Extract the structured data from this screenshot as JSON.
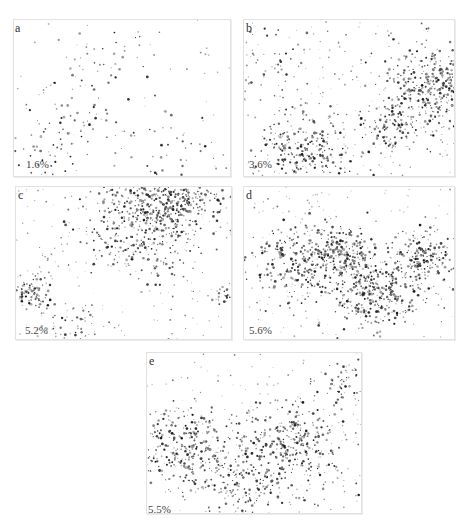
{
  "figure": {
    "panels": [
      {
        "id": "a",
        "letter": "a",
        "percent": "1.6%",
        "box": [
          13,
          19,
          216,
          156
        ],
        "letter_pos": [
          1,
          2
        ],
        "pct_pos": [
          12,
          139
        ],
        "density": 0.25,
        "clusters": [
          [
            30,
            65,
            12,
            60
          ],
          [
            70,
            84,
            12,
            50
          ],
          [
            15,
            88,
            10,
            40
          ],
          [
            40,
            20,
            10,
            30
          ]
        ]
      },
      {
        "id": "b",
        "letter": "b",
        "percent": "3.6%",
        "box": [
          243,
          19,
          210,
          156
        ],
        "letter_pos": [
          2,
          2
        ],
        "pct_pos": [
          5,
          139
        ],
        "density": 1.0,
        "clusters": [
          [
            93,
            43,
            11,
            420
          ],
          [
            30,
            85,
            10,
            260
          ],
          [
            70,
            68,
            6,
            90
          ],
          [
            15,
            25,
            8,
            40
          ]
        ]
      },
      {
        "id": "c",
        "letter": "c",
        "percent": "5.2%",
        "box": [
          15,
          186,
          215,
          152
        ],
        "letter_pos": [
          2,
          2
        ],
        "pct_pos": [
          9,
          138
        ],
        "density": 0.9,
        "clusters": [
          [
            72,
            6,
            12,
            480
          ],
          [
            55,
            28,
            12,
            280
          ],
          [
            6,
            70,
            4,
            90
          ],
          [
            28,
            92,
            6,
            40
          ],
          [
            97,
            70,
            3,
            25
          ]
        ]
      },
      {
        "id": "d",
        "letter": "d",
        "percent": "5.6%",
        "box": [
          243,
          186,
          210,
          152
        ],
        "letter_pos": [
          2,
          2
        ],
        "pct_pos": [
          5,
          138
        ],
        "density": 0.8,
        "clusters": [
          [
            24,
            48,
            10,
            200
          ],
          [
            44,
            45,
            8,
            260
          ],
          [
            62,
            70,
            10,
            320
          ],
          [
            86,
            45,
            7,
            170
          ]
        ]
      },
      {
        "id": "e",
        "letter": "e",
        "percent": "5.5%",
        "box": [
          146,
          352,
          214,
          160
        ],
        "letter_pos": [
          2,
          2
        ],
        "pct_pos": [
          1,
          151
        ],
        "density": 0.9,
        "clusters": [
          [
            20,
            60,
            10,
            300
          ],
          [
            68,
            60,
            11,
            330
          ],
          [
            45,
            87,
            8,
            110
          ],
          [
            90,
            20,
            6,
            60
          ]
        ]
      }
    ]
  }
}
